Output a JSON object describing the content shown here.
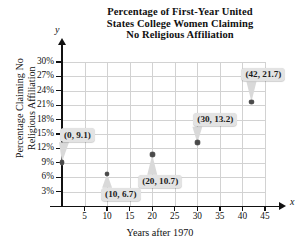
{
  "chart_data": {
    "type": "scatter",
    "title": "Percentage of First-Year United States College Women Claiming No Religious Affiliation",
    "title_lines": [
      "Percentage of First-Year United",
      "States College Women Claiming",
      "No Religious Affiliation"
    ],
    "xlabel": "Years after 1970",
    "ylabel": "Percentage Claiming No Religious Affiliation",
    "ylabel_lines": [
      "Percentage Claiming No",
      "Religious Affiliation"
    ],
    "axis_letter_x": "x",
    "axis_letter_y": "y",
    "xticks": [
      5,
      10,
      15,
      20,
      25,
      30,
      35,
      40,
      45
    ],
    "xtick_labels": [
      "5",
      "10",
      "15",
      "20",
      "25",
      "30",
      "35",
      "40",
      "45"
    ],
    "yticks": [
      3,
      6,
      9,
      12,
      15,
      18,
      21,
      24,
      27,
      30
    ],
    "ytick_labels": [
      "3%",
      "6%",
      "9%",
      "12%",
      "15%",
      "18%",
      "21%",
      "24%",
      "27%",
      "30%"
    ],
    "xlim": [
      0,
      45
    ],
    "ylim": [
      0,
      30
    ],
    "grid": true,
    "legend": null,
    "x": [
      0,
      10,
      20,
      30,
      42
    ],
    "y": [
      9.1,
      6.7,
      10.7,
      13.2,
      21.7
    ],
    "points": [
      {
        "x": 0,
        "y": 9.1,
        "label": "(0, 9.1)"
      },
      {
        "x": 10,
        "y": 6.7,
        "label": "(10, 6.7)"
      },
      {
        "x": 20,
        "y": 10.7,
        "label": "(20, 10.7)"
      },
      {
        "x": 30,
        "y": 13.2,
        "label": "(30, 13.2)"
      },
      {
        "x": 42,
        "y": 21.7,
        "label": "(42, 21.7)"
      }
    ],
    "annotations": [
      "(0, 9.1)",
      "(10, 6.7)",
      "(20, 10.7)",
      "(30, 13.2)",
      "(42, 21.7)"
    ],
    "colors": {
      "point": "#4a4a4a",
      "grid": "#d2d2d2",
      "axis": "#111111",
      "callout_bg": "#e3e3e3",
      "text": "#111111",
      "background": "#ffffff"
    }
  }
}
